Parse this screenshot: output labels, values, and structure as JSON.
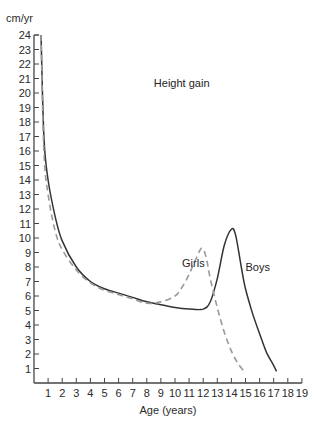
{
  "chart_data": {
    "type": "line",
    "title": "Height gain",
    "xlabel": "Age (years)",
    "ylabel": "cm/yr",
    "xlim": [
      0,
      19
    ],
    "ylim": [
      0,
      24
    ],
    "grid": false,
    "legend": "inline labels",
    "x_ticks": [
      1,
      2,
      3,
      4,
      5,
      6,
      7,
      8,
      9,
      10,
      11,
      12,
      13,
      14,
      15,
      16,
      17,
      18,
      19
    ],
    "y_ticks": [
      1,
      2,
      3,
      4,
      5,
      6,
      7,
      8,
      9,
      10,
      11,
      12,
      13,
      14,
      15,
      16,
      17,
      18,
      19,
      20,
      21,
      22,
      23,
      24
    ],
    "annotations": [
      {
        "text": "Height gain",
        "x": 8.5,
        "y": 20.4
      },
      {
        "text": "Girls",
        "x": 10.5,
        "y": 8.0
      },
      {
        "text": "Boys",
        "x": 15.0,
        "y": 7.7
      }
    ],
    "series": [
      {
        "name": "Boys",
        "style": "solid",
        "color": "#333333",
        "points": [
          [
            0.5,
            24
          ],
          [
            0.7,
            17
          ],
          [
            1,
            14
          ],
          [
            1.5,
            11.5
          ],
          [
            2,
            9.8
          ],
          [
            3,
            8
          ],
          [
            4,
            7
          ],
          [
            5,
            6.5
          ],
          [
            6,
            6.2
          ],
          [
            7,
            5.9
          ],
          [
            8,
            5.6
          ],
          [
            9,
            5.4
          ],
          [
            10,
            5.2
          ],
          [
            11,
            5.1
          ],
          [
            12,
            5.1
          ],
          [
            12.5,
            5.6
          ],
          [
            13,
            7.2
          ],
          [
            13.5,
            9.5
          ],
          [
            14,
            10.6
          ],
          [
            14.3,
            10.2
          ],
          [
            14.7,
            8
          ],
          [
            15,
            6.5
          ],
          [
            15.5,
            4.8
          ],
          [
            16,
            3.4
          ],
          [
            16.5,
            2.1
          ],
          [
            17,
            1.2
          ],
          [
            17.2,
            0.8
          ]
        ]
      },
      {
        "name": "Girls",
        "style": "dashed",
        "color": "#999999",
        "points": [
          [
            0.5,
            24
          ],
          [
            0.7,
            16
          ],
          [
            1,
            13
          ],
          [
            1.5,
            10.5
          ],
          [
            2,
            9.2
          ],
          [
            3,
            7.8
          ],
          [
            4,
            6.9
          ],
          [
            5,
            6.4
          ],
          [
            6,
            6.1
          ],
          [
            7,
            5.8
          ],
          [
            8,
            5.5
          ],
          [
            9,
            5.6
          ],
          [
            10,
            6.0
          ],
          [
            10.5,
            6.6
          ],
          [
            11,
            7.5
          ],
          [
            11.5,
            8.6
          ],
          [
            11.9,
            9.3
          ],
          [
            12.2,
            8.7
          ],
          [
            12.5,
            7.2
          ],
          [
            13,
            5.2
          ],
          [
            13.5,
            3.5
          ],
          [
            14,
            2.2
          ],
          [
            14.5,
            1.3
          ],
          [
            15,
            0.7
          ]
        ]
      }
    ]
  }
}
